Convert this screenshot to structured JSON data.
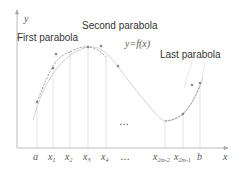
{
  "labels": {
    "y_axis": "y",
    "x_axis": "x",
    "first_parabola": "First parabola",
    "second_parabola": "Second parabola",
    "last_parabola": "Last parabola",
    "function": "y=f(x)",
    "ellipsis_mid": "…",
    "ellipsis_axis": "…"
  },
  "ticks": [
    {
      "base": "a",
      "sub": ""
    },
    {
      "base": "x",
      "sub": "1"
    },
    {
      "base": "x",
      "sub": "2"
    },
    {
      "base": "x",
      "sub": "3"
    },
    {
      "base": "x",
      "sub": "4"
    },
    {
      "base": "…",
      "sub": ""
    },
    {
      "base": "x",
      "sub": "2m-2"
    },
    {
      "base": "x",
      "sub": "2m-1"
    },
    {
      "base": "b",
      "sub": ""
    }
  ],
  "colors": {
    "axis": "#aaaaaa",
    "curve": "#cccccc",
    "parabola": "#888888",
    "gridline": "#dddddd",
    "point": "#888888",
    "text": "#333333"
  }
}
